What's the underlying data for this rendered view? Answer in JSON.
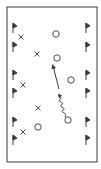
{
  "diagram": {
    "title": "",
    "colors": {
      "line": "#3a3a3a",
      "background": "#ffffff"
    },
    "field": {
      "x": 7,
      "y": 7,
      "width": 90,
      "height": 155
    },
    "flags_left": [
      {
        "x": 13,
        "y": 23
      },
      {
        "x": 13,
        "y": 42
      },
      {
        "x": 13,
        "y": 70
      },
      {
        "x": 13,
        "y": 88
      },
      {
        "x": 13,
        "y": 117
      },
      {
        "x": 13,
        "y": 135
      }
    ],
    "flags_right": [
      {
        "x": 86,
        "y": 23
      },
      {
        "x": 86,
        "y": 42
      },
      {
        "x": 86,
        "y": 70
      },
      {
        "x": 86,
        "y": 88
      },
      {
        "x": 86,
        "y": 117
      },
      {
        "x": 86,
        "y": 135
      }
    ],
    "defenders_x": [
      {
        "label": "X",
        "x": 21,
        "y": 37
      },
      {
        "label": "X",
        "x": 37,
        "y": 54
      },
      {
        "label": "X",
        "x": 23,
        "y": 85
      },
      {
        "label": "X",
        "x": 38,
        "y": 108
      },
      {
        "label": "X",
        "x": 23,
        "y": 132
      }
    ],
    "attackers_o": [
      {
        "label": "O",
        "x": 56,
        "y": 34
      },
      {
        "label": "O",
        "x": 57,
        "y": 58
      },
      {
        "label": "O",
        "x": 71,
        "y": 80
      },
      {
        "label": "O",
        "x": 68,
        "y": 120
      },
      {
        "label": "O",
        "x": 38,
        "y": 127
      }
    ],
    "pass_arrow": {
      "type": "pass",
      "from": [
        59,
        89
      ],
      "to": [
        53,
        66
      ]
    },
    "dribble_arrow": {
      "type": "dribble",
      "from": [
        65,
        117
      ],
      "to": [
        59,
        95
      ]
    }
  }
}
